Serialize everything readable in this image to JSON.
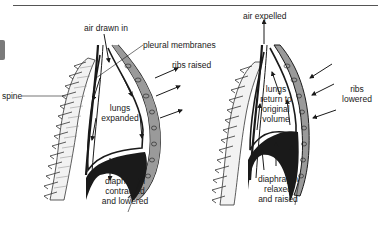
{
  "figure": {
    "topic": "mechanics of breathing",
    "inhalation": {
      "labels": {
        "air": "air drawn in",
        "membranes": "pleural membranes",
        "ribs": "ribs raised",
        "spine": "spine",
        "lungs_1": "lungs",
        "lungs_2": "expanded",
        "diaphragm_1": "diaphragm",
        "diaphragm_2": "contracted",
        "diaphragm_3": "and lowered"
      }
    },
    "exhalation": {
      "labels": {
        "air": "air expelled",
        "ribs_1": "ribs",
        "ribs_2": "lowered",
        "lungs_1": "lungs",
        "lungs_2": "return to",
        "lungs_3": "original",
        "lungs_4": "volume",
        "diaphragm_1": "diaphragm",
        "diaphragm_2": "relaxed",
        "diaphragm_3": "and raised"
      }
    },
    "colors": {
      "ink": "#1a1a1a",
      "rib_fill": "#9a9a9a",
      "spine_fill": "#f2f2f2",
      "background": "#ffffff"
    }
  }
}
